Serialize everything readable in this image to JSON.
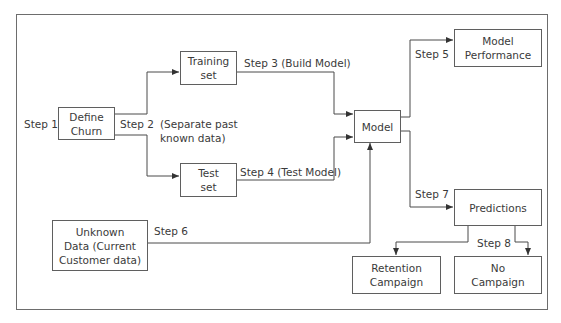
{
  "diagram": {
    "nodes": {
      "define_churn": "Define\nChurn",
      "training_set": "Training\nset",
      "test_set": "Test\nset",
      "model": "Model",
      "model_performance": "Model\nPerformance",
      "predictions": "Predictions",
      "unknown_data": "Unknown\nData (Current\nCustomer data)",
      "retention_campaign": "Retention\nCampaign",
      "no_campaign": "No\nCampaign"
    },
    "labels": {
      "step1": "Step 1",
      "step2": "Step 2",
      "step2_note": "(Separate past\nknown data)",
      "step3": "Step 3 (Build Model)",
      "step4": "Step 4 (Test Model)",
      "step5": "Step 5",
      "step6": "Step 6",
      "step7": "Step 7",
      "step8": "Step 8"
    },
    "edges": [
      {
        "from": "define_churn",
        "to": "training_set",
        "label": "Step 2"
      },
      {
        "from": "define_churn",
        "to": "test_set",
        "label": "Step 2"
      },
      {
        "from": "training_set",
        "to": "model",
        "label": "Step 3 (Build Model)"
      },
      {
        "from": "test_set",
        "to": "model",
        "label": "Step 4 (Test Model)"
      },
      {
        "from": "model",
        "to": "model_performance",
        "label": "Step 5"
      },
      {
        "from": "unknown_data",
        "to": "model",
        "label": "Step 6"
      },
      {
        "from": "model",
        "to": "predictions",
        "label": "Step 7"
      },
      {
        "from": "predictions",
        "to": "retention_campaign",
        "label": "Step 8"
      },
      {
        "from": "predictions",
        "to": "no_campaign",
        "label": "Step 8"
      }
    ],
    "colors": {
      "line": "#4a4a4a",
      "border": "#5f5f5f",
      "text": "#3a3a3a"
    }
  }
}
